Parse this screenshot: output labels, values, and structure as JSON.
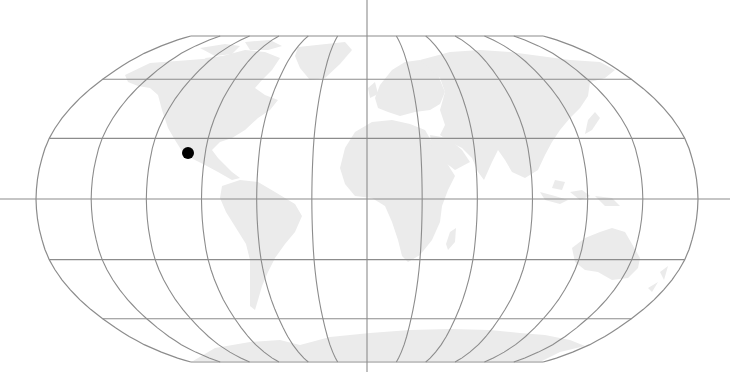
{
  "map": {
    "projection": "Robinson",
    "center_x": 367,
    "center_y": 199,
    "half_width": 331,
    "half_height": 163,
    "graticule": {
      "meridian_step_deg": 30,
      "parallel_step_deg": 30,
      "parallels_deg": [
        -90,
        -60,
        -30,
        0,
        30,
        60,
        90
      ],
      "meridians_deg": [
        -180,
        -150,
        -120,
        -90,
        -60,
        -30,
        0,
        30,
        60,
        90,
        120,
        150,
        180
      ]
    },
    "axes": {
      "equator_extends_full_width": true,
      "prime_meridian_extends_full_height": true
    },
    "colors": {
      "background": "#ffffff",
      "land": "#ebebeb",
      "grid": "#8c8c8c",
      "marker": "#000000"
    },
    "markers": [
      {
        "label": "Mexico",
        "x": 188,
        "y": 153,
        "radius": 6,
        "color": "#000000"
      }
    ]
  }
}
